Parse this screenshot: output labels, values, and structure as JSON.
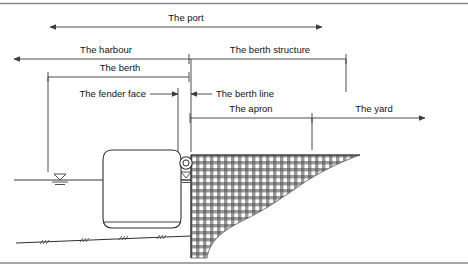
{
  "figure": {
    "colors": {
      "line": "#3a3a3a",
      "border": "#8a8a8a",
      "hatch": "#6f6f6f",
      "hull": "#2f2f2f",
      "text": "#141414"
    }
  },
  "labels": {
    "port": "The port",
    "harbour": "The harbour",
    "berth_structure": "The berth structure",
    "berth": "The berth",
    "fender_face": "The fender face",
    "berth_line": "The berth line",
    "apron": "The apron",
    "yard": "The yard"
  },
  "dimensions": [
    {
      "id": "port",
      "label": "The port",
      "x1": 50,
      "x2": 322,
      "y": 27,
      "arrow_left": true,
      "arrow_right": true,
      "text_x": 186,
      "text_y": 21
    },
    {
      "id": "harbour",
      "label": "The harbour",
      "x1": 14,
      "x2": 189,
      "y": 59,
      "arrow_left": true,
      "arrow_right": false,
      "text_x": 106,
      "text_y": 53
    },
    {
      "id": "berth-structure",
      "label": "The berth structure",
      "x1": 189,
      "x2": 346,
      "y": 59,
      "arrow_left": false,
      "arrow_right": false,
      "text_x": 270,
      "text_y": 53
    },
    {
      "id": "berth",
      "label": "The berth",
      "x1": 48,
      "x2": 189,
      "y": 77,
      "arrow_left": false,
      "arrow_right": false,
      "text_x": 120,
      "text_y": 71
    },
    {
      "id": "fender-face",
      "label": "The fender face",
      "x1": 98,
      "x2": 178,
      "y": 94,
      "arrow_left": false,
      "arrow_right": true,
      "text_x": 82,
      "text_y": 97
    },
    {
      "id": "berth-line",
      "label": "The berth line",
      "x1": 191,
      "x2": 212,
      "y": 94,
      "arrow_left": true,
      "arrow_right": false,
      "text_x": 216,
      "text_y": 97
    },
    {
      "id": "apron",
      "label": "The apron",
      "x1": 190,
      "x2": 312,
      "y": 118,
      "arrow_left": false,
      "arrow_right": false,
      "text_x": 251,
      "text_y": 112
    },
    {
      "id": "yard",
      "label": "The yard",
      "x1": 312,
      "x2": 425,
      "y": 118,
      "arrow_left": false,
      "arrow_right": true,
      "text_x": 374,
      "text_y": 112
    }
  ],
  "features": {
    "ship": "vessel-hull-section",
    "fender": "circular-fender",
    "water_level_symbol": "water-surface-marker",
    "seabed": "seabed-line-with-hatching",
    "quay": "hatched-berth-structure-mass"
  }
}
